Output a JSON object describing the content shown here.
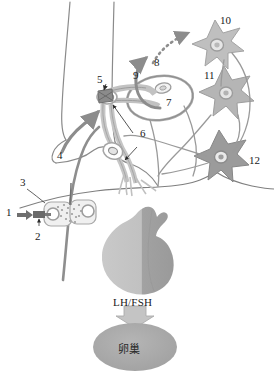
{
  "figure": {
    "background_color": "#ffffff"
  },
  "labels": {
    "n1": "1",
    "n2": "2",
    "n3": "3",
    "n4": "4",
    "n5": "5",
    "n6": "6",
    "n7": "7",
    "n8": "8",
    "n9": "9",
    "n10": "10",
    "n11": "11",
    "n12": "12"
  },
  "text": {
    "hormone": "LH/FSH",
    "organ": "卵巢"
  },
  "colors": {
    "outline": "#8a8a8a",
    "dark_outline": "#6d6d6d",
    "neuron_light": "#bdbdbd",
    "neuron_mid": "#b0b0b0",
    "neuron_dark": "#8f8f8f",
    "tract_gray": "#9a9a9a",
    "pituitary_light": "#c3c3c3",
    "pituitary_dark": "#a0a0a0",
    "ovary_fill": "#a8a8a8",
    "arrow_gray": "#8c8c8c",
    "label_text": "#1a1a1a"
  },
  "elements": {
    "neuron_10": "star-neuron-upper",
    "neuron_11": "star-neuron-middle",
    "neuron_12": "star-neuron-lower",
    "nucleus_7": "arcuate-nucleus-oval",
    "terminal_5": "axon-terminal",
    "varicosity_6": "axon-varicosity",
    "pituitary": "pituitary-gland",
    "ovary": "ovary-oval",
    "injection_1": "injection-arrow",
    "syringe_2": "micro-injection-needle",
    "cell_cluster_3": "secretory-cell-cluster",
    "tract_4": "descending-tract",
    "dotted_arrow_8": "dotted-feedback-arrow",
    "curved_arrow_9": "curved-projection-arrow",
    "hormone_arrow": "lh-fsh-down-arrow"
  }
}
